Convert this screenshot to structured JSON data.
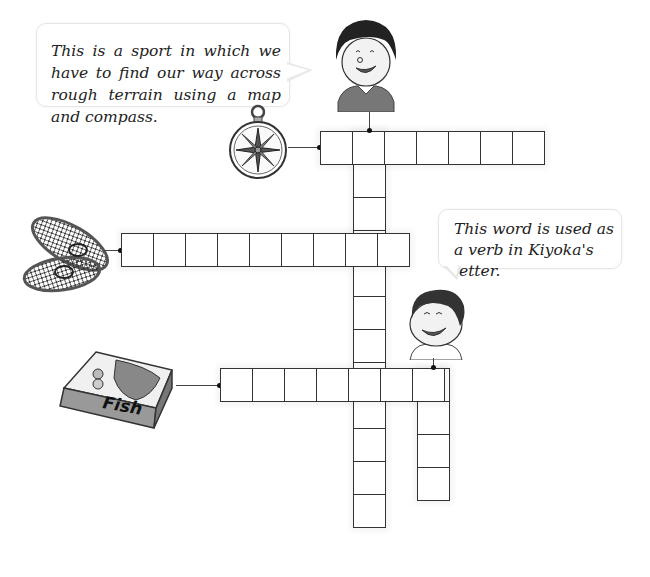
{
  "clues": {
    "across_1_bubble": "This is a sport in which we have to find our way across rough terrain using a map and compass.",
    "down_2_bubble": "This word is used as a verb in Kiyoka's letter."
  },
  "illustrations": {
    "compass": "compass-icon",
    "snowshoes": "snowshoes-icon",
    "fish_box": {
      "icon": "fish-box-icon",
      "label": "Fish",
      "sublabel": "8 pieces"
    },
    "girl": "girl-character",
    "boy": "boy-character"
  },
  "crossword": {
    "row1": {
      "cells": 7,
      "clue_image": "compass"
    },
    "row2": {
      "cells": 9,
      "clue_image": "snowshoes"
    },
    "row3": {
      "cells": 7,
      "clue_image": "fish box"
    },
    "down1": {
      "cells": 12,
      "clue_image": "girl speech bubble"
    },
    "down2": {
      "cells": 4,
      "clue_image": "boy speech bubble"
    }
  },
  "colors": {
    "grid_line": "#333333",
    "bubble_border": "#e6e6e6",
    "text": "#222222"
  }
}
